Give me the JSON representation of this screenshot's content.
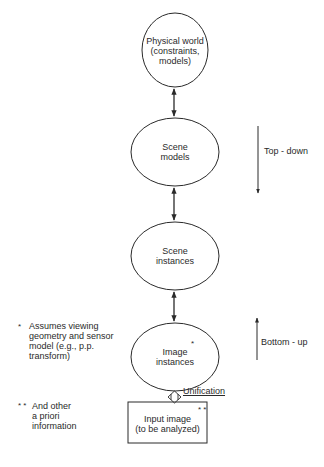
{
  "diagram": {
    "nodes": [
      {
        "id": "physical-world",
        "shape": "ellipse",
        "line1": "Physical world",
        "line2": "(constraints,",
        "line3": "models)"
      },
      {
        "id": "scene-models",
        "shape": "ellipse",
        "line1": "Scene",
        "line2": "models"
      },
      {
        "id": "scene-instances",
        "shape": "ellipse",
        "line1": "Scene",
        "line2": "instances"
      },
      {
        "id": "image-instances",
        "shape": "ellipse",
        "line1": "Image",
        "line2": "instances",
        "marker": "*"
      },
      {
        "id": "input-image",
        "shape": "rectangle",
        "line1": "Input image",
        "line2": "(to be analyzed)",
        "marker": "* *"
      }
    ],
    "edges": [
      {
        "from": "physical-world",
        "to": "scene-models",
        "type": "bidirectional"
      },
      {
        "from": "scene-models",
        "to": "scene-instances",
        "type": "bidirectional"
      },
      {
        "from": "scene-instances",
        "to": "image-instances",
        "type": "bidirectional"
      },
      {
        "from": "image-instances",
        "to": "input-image",
        "type": "double-bidirectional",
        "label": "Unification"
      }
    ],
    "directions": {
      "top_down": "Top - down",
      "bottom_up": "Bottom - up"
    },
    "footnotes": {
      "single_star_marker": "*",
      "single_star_line1": "Assumes viewing",
      "single_star_line2": "geometry and sensor",
      "single_star_line3": "model (e.g., p.p.",
      "single_star_line4": "transform)",
      "double_star_marker": "* *",
      "double_star_line1": "And other",
      "double_star_line2": "a priori",
      "double_star_line3": "information"
    },
    "colors": {
      "stroke": "#2a2a2a",
      "background": "#ffffff"
    }
  }
}
